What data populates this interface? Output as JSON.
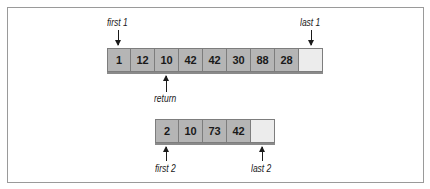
{
  "diagram": {
    "range1": {
      "values": [
        "1",
        "12",
        "10",
        "42",
        "42",
        "30",
        "88",
        "28",
        ""
      ],
      "first_label": "first 1",
      "last_label": "last 1",
      "return_label": "return"
    },
    "range2": {
      "values": [
        "2",
        "10",
        "73",
        "42",
        ""
      ],
      "first_label": "first 2",
      "last_label": "last 2"
    },
    "colors": {
      "cell_fill": "#b5b5b5",
      "empty_cell_fill": "#ececec",
      "border": "#7d7d7d"
    }
  }
}
